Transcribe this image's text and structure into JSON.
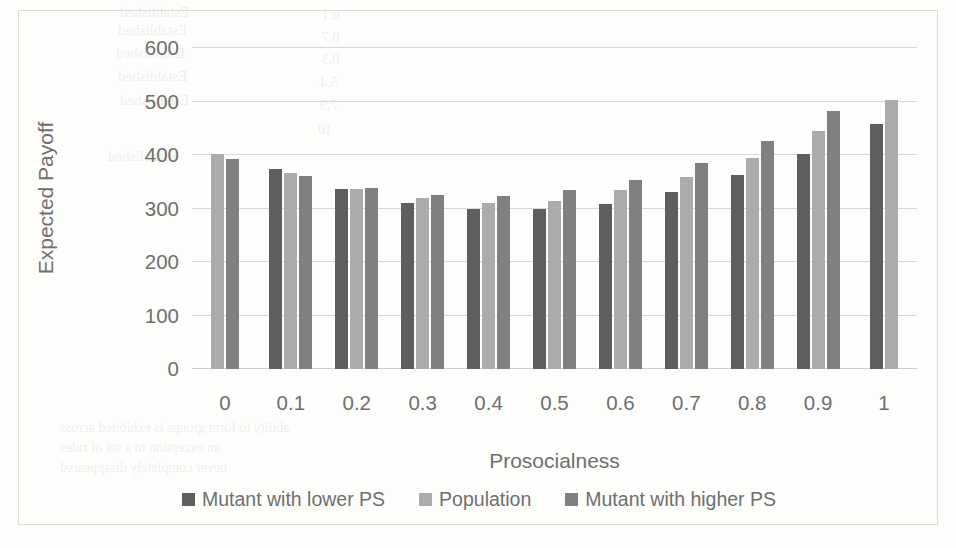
{
  "chart_data": {
    "type": "bar",
    "title": "",
    "xlabel": "Prosocialness",
    "ylabel": "Expected Payoff",
    "ylim": [
      0,
      600
    ],
    "ytick_step": 100,
    "grid": true,
    "legend_position": "bottom",
    "categories": [
      "0",
      "0.1",
      "0.2",
      "0.3",
      "0.4",
      "0.5",
      "0.6",
      "0.7",
      "0.8",
      "0.9",
      "1"
    ],
    "yticks": [
      "0",
      "100",
      "200",
      "300",
      "400",
      "500",
      "600"
    ],
    "series": [
      {
        "name": "Mutant with lower PS",
        "color": "#5e5e5e",
        "values": [
          null,
          373,
          336,
          311,
          300,
          300,
          308,
          331,
          363,
          402,
          458
        ]
      },
      {
        "name": "Population",
        "color": "#ababab",
        "values": [
          401,
          366,
          337,
          319,
          310,
          314,
          334,
          359,
          395,
          444,
          503
        ]
      },
      {
        "name": "Mutant with higher PS",
        "color": "#808080",
        "values": [
          393,
          361,
          338,
          325,
          324,
          334,
          354,
          385,
          426,
          483,
          null
        ]
      }
    ]
  },
  "legend": {
    "items": [
      {
        "label": "Mutant with lower PS",
        "key": "lower"
      },
      {
        "label": "Population",
        "key": "pop"
      },
      {
        "label": "Mutant with higher PS",
        "key": "higher"
      }
    ]
  },
  "bleed_text": [
    {
      "t": "Established",
      "x": 120,
      "y": 4,
      "s": 15
    },
    {
      "t": "Established",
      "x": 118,
      "y": 22,
      "s": 15
    },
    {
      "t": "Established",
      "x": 116,
      "y": 45,
      "s": 15
    },
    {
      "t": "Established",
      "x": 118,
      "y": 68,
      "s": 15
    },
    {
      "t": "Established",
      "x": 120,
      "y": 92,
      "s": 15
    },
    {
      "t": "Established",
      "x": 108,
      "y": 148,
      "s": 15
    },
    {
      "t": "0.1",
      "x": 322,
      "y": 8,
      "s": 14
    },
    {
      "t": "0.7",
      "x": 322,
      "y": 30,
      "s": 14
    },
    {
      "t": "0.3",
      "x": 322,
      "y": 52,
      "s": 14
    },
    {
      "t": "5.4",
      "x": 320,
      "y": 75,
      "s": 14
    },
    {
      "t": "7.9",
      "x": 320,
      "y": 98,
      "s": 14
    },
    {
      "t": "10",
      "x": 318,
      "y": 122,
      "s": 14
    },
    {
      "t": "ability to form groups is exhibited across",
      "x": 60,
      "y": 420,
      "s": 14
    },
    {
      "t": "an exception to a set of rules",
      "x": 60,
      "y": 440,
      "s": 14
    },
    {
      "t": "never completely disappeared",
      "x": 60,
      "y": 460,
      "s": 14
    }
  ]
}
